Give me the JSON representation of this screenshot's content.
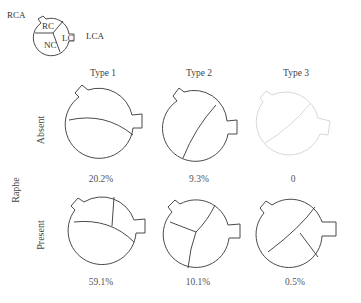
{
  "legend": {
    "labels": {
      "rca": "RCA",
      "lca": "LCA",
      "rc": "RC",
      "lc": "LC",
      "nc": "NC"
    }
  },
  "columns": [
    {
      "label": "Type 1"
    },
    {
      "label": "Type 2"
    },
    {
      "label": "Type 3"
    }
  ],
  "row_axis_label": "Raphe",
  "rows": [
    {
      "label": "Absent",
      "percentages": [
        "20.2%",
        "9.3%",
        "0"
      ]
    },
    {
      "label": "Present",
      "percentages": [
        "59.1%",
        "10.1%",
        "0.5%"
      ]
    }
  ],
  "colors": {
    "stroke": "#4a4a4a",
    "faded_stroke": "#d8d8d8"
  }
}
